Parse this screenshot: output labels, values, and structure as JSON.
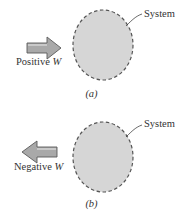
{
  "panels": [
    {
      "id": "a",
      "caption": "(a)",
      "system_label": "System",
      "work_label": "Positive",
      "work_symbol": "W",
      "arrow_direction": "right"
    },
    {
      "id": "b",
      "caption": "(b)",
      "system_label": "System",
      "work_label": "Negative",
      "work_symbol": "W",
      "arrow_direction": "left"
    }
  ],
  "colors": {
    "system_fill": "#d6d6d6",
    "system_border": "#555555",
    "arrow_fill": "#a9a9a9",
    "arrow_stroke": "#5a5a5a"
  }
}
